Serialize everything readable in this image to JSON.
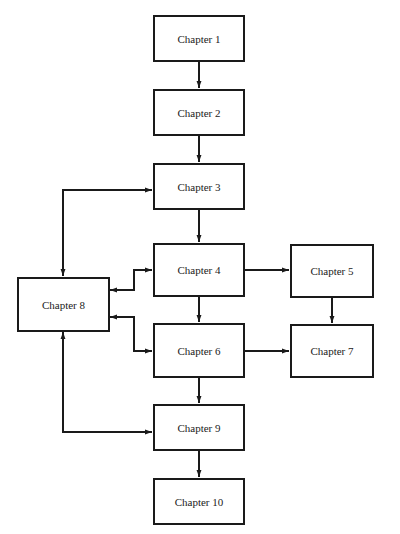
{
  "diagram": {
    "type": "chapter-dependency-flowchart",
    "nodes": [
      {
        "id": "ch1",
        "label": "Chapter 1"
      },
      {
        "id": "ch2",
        "label": "Chapter 2"
      },
      {
        "id": "ch3",
        "label": "Chapter 3"
      },
      {
        "id": "ch4",
        "label": "Chapter 4"
      },
      {
        "id": "ch5",
        "label": "Chapter 5"
      },
      {
        "id": "ch6",
        "label": "Chapter 6"
      },
      {
        "id": "ch7",
        "label": "Chapter 7"
      },
      {
        "id": "ch8",
        "label": "Chapter 8"
      },
      {
        "id": "ch9",
        "label": "Chapter 9"
      },
      {
        "id": "ch10",
        "label": "Chapter 10"
      }
    ],
    "edges": [
      {
        "from": "Chapter 1",
        "to": "Chapter 2",
        "direction": "forward"
      },
      {
        "from": "Chapter 2",
        "to": "Chapter 3",
        "direction": "forward"
      },
      {
        "from": "Chapter 3",
        "to": "Chapter 4",
        "direction": "forward"
      },
      {
        "from": "Chapter 4",
        "to": "Chapter 5",
        "direction": "forward"
      },
      {
        "from": "Chapter 4",
        "to": "Chapter 6",
        "direction": "forward"
      },
      {
        "from": "Chapter 5",
        "to": "Chapter 7",
        "direction": "forward"
      },
      {
        "from": "Chapter 6",
        "to": "Chapter 7",
        "direction": "forward"
      },
      {
        "from": "Chapter 6",
        "to": "Chapter 9",
        "direction": "forward"
      },
      {
        "from": "Chapter 9",
        "to": "Chapter 10",
        "direction": "forward"
      },
      {
        "from": "Chapter 8",
        "to": "Chapter 3",
        "direction": "bidirectional"
      },
      {
        "from": "Chapter 8",
        "to": "Chapter 4",
        "direction": "bidirectional"
      },
      {
        "from": "Chapter 8",
        "to": "Chapter 6",
        "direction": "bidirectional"
      },
      {
        "from": "Chapter 8",
        "to": "Chapter 9",
        "direction": "bidirectional"
      }
    ],
    "colors": {
      "stroke": "#1a1a1a",
      "background": "#ffffff",
      "text": "#222222"
    }
  }
}
